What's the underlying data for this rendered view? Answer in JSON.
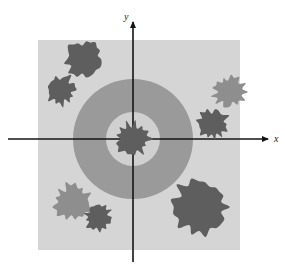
{
  "figure": {
    "title": "",
    "axes": {
      "x_label": "x",
      "y_label": "y",
      "origin": [
        133,
        139
      ],
      "x_axis": {
        "from": [
          8,
          139
        ],
        "to": [
          268,
          139
        ],
        "arrow": "right"
      },
      "y_axis": {
        "from": [
          133,
          262
        ],
        "to": [
          133,
          22
        ],
        "arrow": "up"
      },
      "axis_color": "#141414"
    },
    "plot_area": {
      "name": "sample-space-square",
      "x": 38,
      "y": 40,
      "width": 202,
      "height": 210,
      "fill": "#d5d5d5"
    },
    "annulus": {
      "name": "target-annulus",
      "center": [
        133,
        139
      ],
      "outer_radius": 60,
      "inner_radius": 27,
      "ring_fill": "#9a9a9a",
      "inner_fill": "#d0d0d0"
    },
    "colors": {
      "background": "#ffffff",
      "square": "#d5d5d5",
      "ring": "#9a9a9a",
      "inner_disk": "#d0d0d0",
      "blob_dark": "#5e5e5e",
      "blob_light": "#8e8e8e",
      "axis": "#141414"
    },
    "blobs": [
      {
        "name": "blob-center-origin",
        "cx": 133,
        "cy": 139,
        "r": 17,
        "tone": "dark",
        "seed": 11
      },
      {
        "name": "blob-upper-left-outer",
        "cx": 84,
        "cy": 59,
        "r": 19,
        "tone": "dark",
        "seed": 3
      },
      {
        "name": "blob-left-upper",
        "cx": 61,
        "cy": 90,
        "r": 15,
        "tone": "dark",
        "seed": 7
      },
      {
        "name": "blob-right-upper",
        "cx": 229,
        "cy": 92,
        "r": 16,
        "tone": "light",
        "seed": 5
      },
      {
        "name": "blob-right-lower",
        "cx": 213,
        "cy": 124,
        "r": 15,
        "tone": "dark",
        "seed": 9
      },
      {
        "name": "blob-lower-right-large",
        "cx": 202,
        "cy": 207,
        "r": 29,
        "tone": "dark",
        "seed": 2
      },
      {
        "name": "blob-lower-left-light",
        "cx": 73,
        "cy": 202,
        "r": 19,
        "tone": "light",
        "seed": 4
      },
      {
        "name": "blob-lower-left-dark",
        "cx": 98,
        "cy": 217,
        "r": 14,
        "tone": "dark",
        "seed": 8
      }
    ]
  }
}
